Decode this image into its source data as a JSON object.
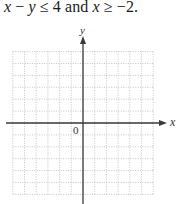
{
  "problem": {
    "parts": [
      {
        "text": "x",
        "italic": true
      },
      {
        "text": " − ",
        "italic": false
      },
      {
        "text": "y",
        "italic": true
      },
      {
        "text": " ≤ 4 and ",
        "italic": false
      },
      {
        "text": "x",
        "italic": true
      },
      {
        "text": " ≥ −2.",
        "italic": false
      }
    ]
  },
  "graph": {
    "x_axis_label": "x",
    "y_axis_label": "y",
    "origin_label": "0",
    "grid": {
      "columns_left": 6,
      "columns_right": 6,
      "rows_above": 6,
      "rows_below": 6,
      "line_style": "dotted",
      "line_color": "#b8b8b8"
    },
    "axis_color": "#3a3a3a"
  }
}
